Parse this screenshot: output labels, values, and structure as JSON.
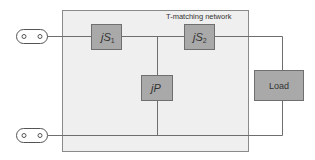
{
  "diagram": {
    "network_title": "T-matching network",
    "components": {
      "series_1": {
        "prefix": "j",
        "symbol": "S",
        "subscript": "1"
      },
      "series_2": {
        "prefix": "j",
        "symbol": "S",
        "subscript": "2"
      },
      "shunt": {
        "prefix": "j",
        "symbol": "P"
      },
      "load": {
        "label": "Load"
      }
    },
    "ports": [
      "input-port-top",
      "input-port-bottom"
    ],
    "colors": {
      "component_fill": "#a9a9a9",
      "network_background": "#efefef",
      "wire": "#6e6e6e"
    }
  }
}
